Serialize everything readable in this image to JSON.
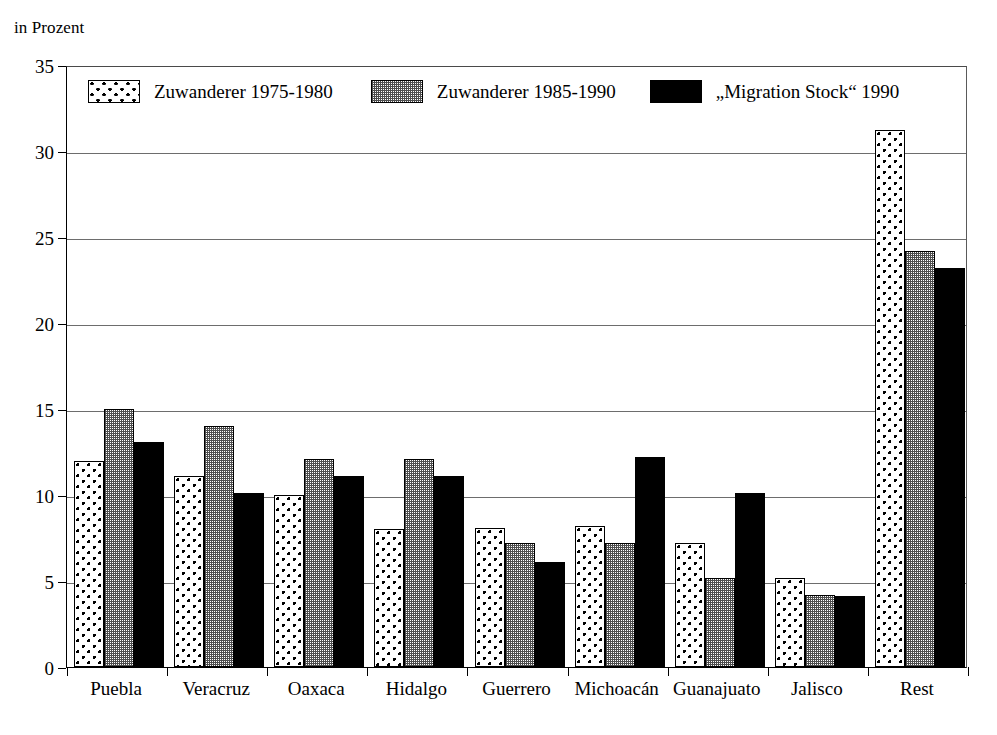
{
  "axis_unit_label": "in Prozent",
  "legend": {
    "position": "inside-top-left",
    "entries": [
      {
        "label": "Zuwanderer 1975-1980",
        "swatch": "dotted-pattern-swatch",
        "color": "#ffffff"
      },
      {
        "label": "Zuwanderer 1985-1990",
        "swatch": "gray-stipple-swatch",
        "color": "#9a9a9a"
      },
      {
        "label": "„Migration Stock“ 1990",
        "swatch": "solid-black-swatch",
        "color": "#000000"
      }
    ]
  },
  "chart_data": {
    "type": "bar",
    "title": "",
    "subtitle": "",
    "xlabel": "",
    "ylabel": "in Prozent",
    "ylim": [
      0,
      35
    ],
    "yticks": [
      0,
      5,
      10,
      15,
      20,
      25,
      30,
      35
    ],
    "ytick_labels": [
      "0",
      "5",
      "10",
      "15",
      "20",
      "25",
      "30",
      "35"
    ],
    "grid": true,
    "legend_position": "inside-top-left",
    "categories": [
      "Puebla",
      "Veracruz",
      "Oaxaca",
      "Hidalgo",
      "Guerrero",
      "Michoacán",
      "Guanajuato",
      "Jalisco",
      "Rest"
    ],
    "series": [
      {
        "name": "Zuwanderer 1975-1980",
        "values": [
          12.0,
          11.1,
          10.0,
          8.0,
          8.1,
          8.2,
          7.2,
          5.2,
          31.2
        ]
      },
      {
        "name": "Zuwanderer 1985-1990",
        "values": [
          15.0,
          14.0,
          12.1,
          12.1,
          7.2,
          7.2,
          5.2,
          4.2,
          24.2
        ]
      },
      {
        "name": "„Migration Stock“ 1990",
        "values": [
          13.1,
          10.1,
          11.1,
          11.1,
          6.1,
          12.2,
          10.1,
          4.1,
          23.2
        ]
      }
    ]
  }
}
